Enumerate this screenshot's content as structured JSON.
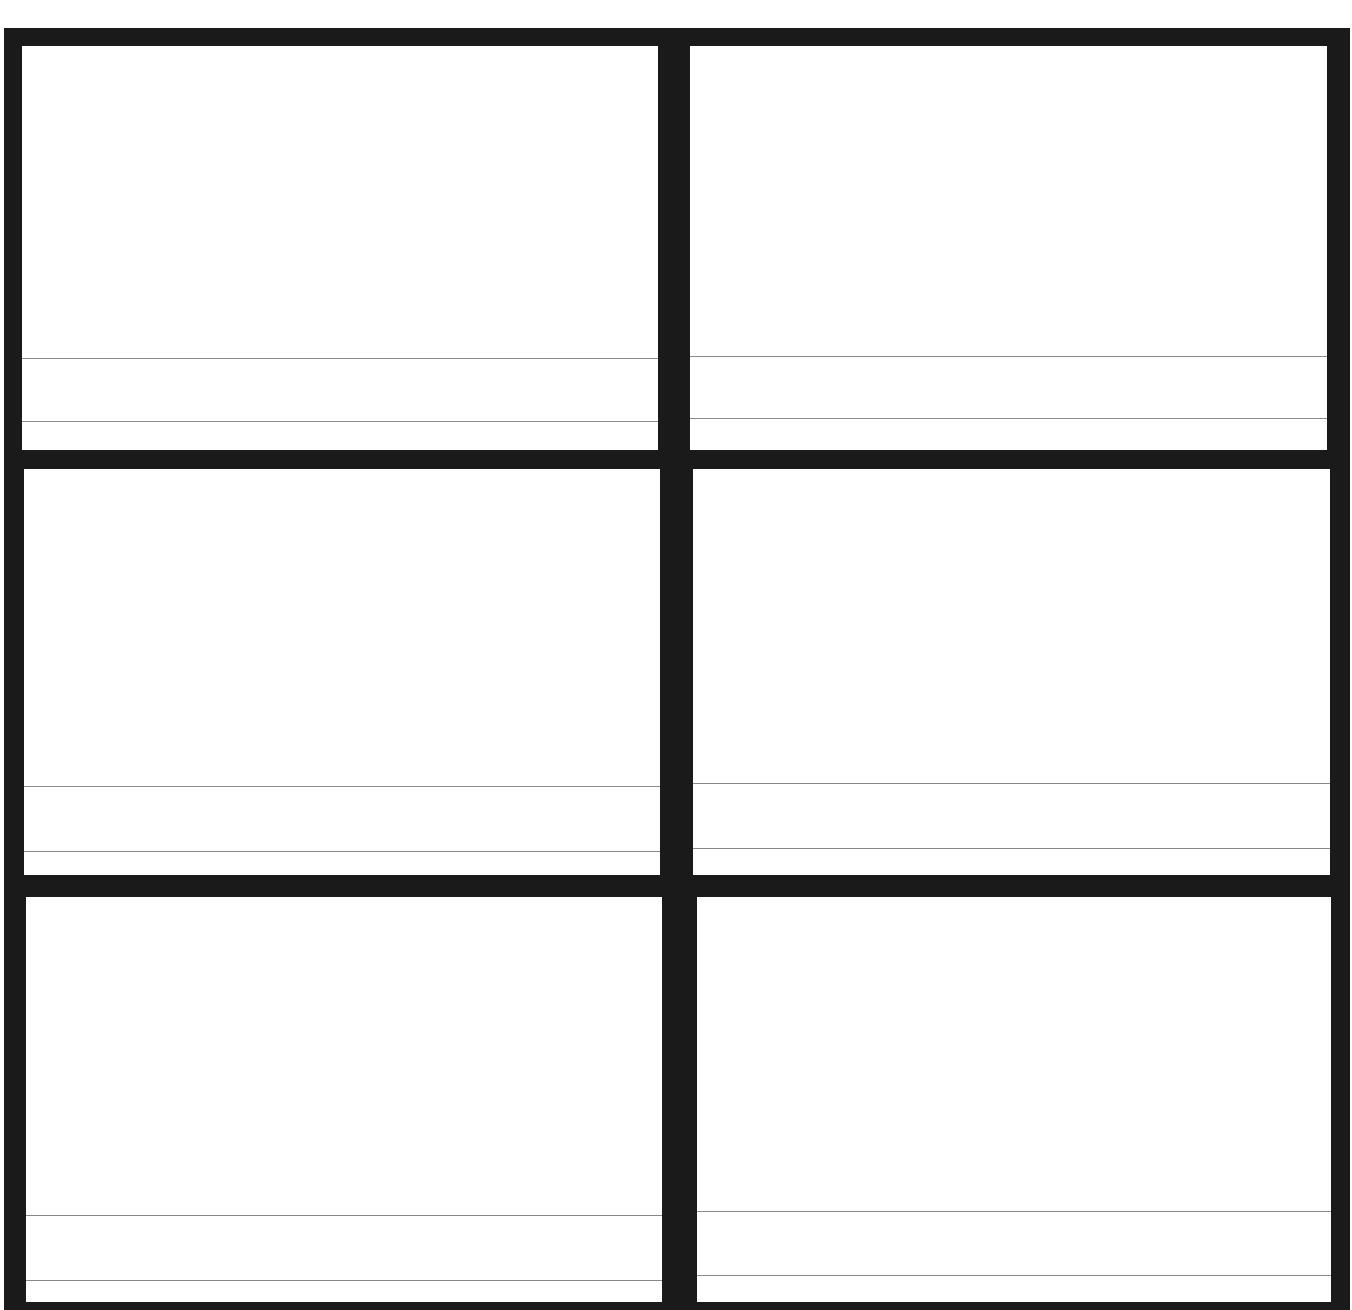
{
  "document": {
    "type": "storyboard-template",
    "layout": {
      "rows": 3,
      "columns": 2
    },
    "colors": {
      "frame": "#1a1a1a",
      "panel": "#ffffff",
      "rule": "#8a8a8a"
    }
  },
  "panels": [
    {
      "row": 1,
      "col": 1,
      "caption_lines": [
        "",
        ""
      ]
    },
    {
      "row": 1,
      "col": 2,
      "caption_lines": [
        "",
        ""
      ]
    },
    {
      "row": 2,
      "col": 1,
      "caption_lines": [
        "",
        ""
      ]
    },
    {
      "row": 2,
      "col": 2,
      "caption_lines": [
        "",
        ""
      ]
    },
    {
      "row": 3,
      "col": 1,
      "caption_lines": [
        "",
        ""
      ]
    },
    {
      "row": 3,
      "col": 2,
      "caption_lines": [
        "",
        ""
      ]
    }
  ]
}
